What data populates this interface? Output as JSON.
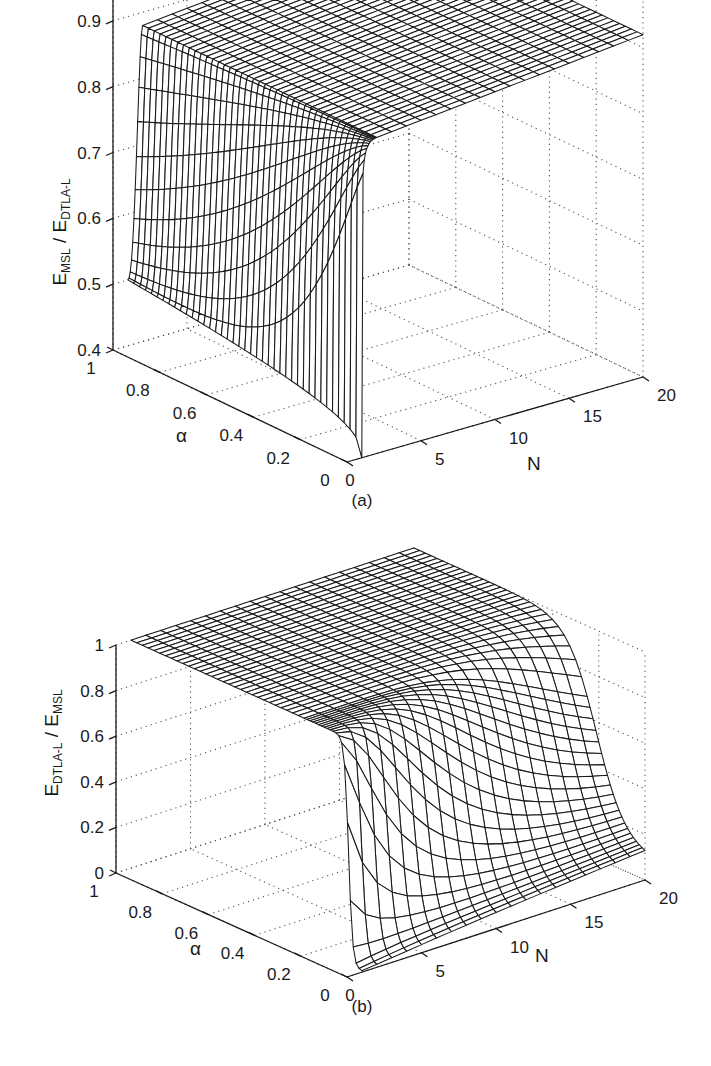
{
  "figures": [
    {
      "id": "a",
      "panel_label": "(a)",
      "z_label_main_1": "E",
      "z_label_sub_1": "MSL",
      "z_label_sep": " / E",
      "z_label_sub_2": "DTLA-L",
      "alpha_label": "α",
      "n_label": "N",
      "z_ticks": [
        "0.4",
        "0.5",
        "0.6",
        "0.7",
        "0.8",
        "0.9",
        "1"
      ],
      "alpha_ticks": [
        "0",
        "0.2",
        "0.4",
        "0.6",
        "0.8",
        "1"
      ],
      "n_ticks": [
        "0",
        "5",
        "10",
        "15",
        "20"
      ]
    },
    {
      "id": "b",
      "panel_label": "(b)",
      "z_label_main_1": "E",
      "z_label_sub_1": "DTLA-L",
      "z_label_sep": " / E",
      "z_label_sub_2": "MSL",
      "alpha_label": "α",
      "n_label": "N",
      "z_ticks": [
        "0",
        "0.2",
        "0.4",
        "0.6",
        "0.8",
        "1"
      ],
      "alpha_ticks": [
        "0",
        "0.2",
        "0.4",
        "0.6",
        "0.8",
        "1"
      ],
      "n_ticks": [
        "0",
        "5",
        "10",
        "15",
        "20"
      ]
    }
  ],
  "chart_data": [
    {
      "type": "surface",
      "title": "(a)",
      "xlabel": "N",
      "ylabel": "α",
      "zlabel": "E_MSL / E_DTLA-L",
      "xlim": [
        0,
        20
      ],
      "ylim": [
        0,
        1
      ],
      "zlim": [
        0.4,
        1
      ],
      "grid": true,
      "description": "Ratio rises from ~0.5 (α=1, N=1) toward 1; at α→0 ratio drops sharply near 0.4 for small N; for N ≥ ~2 the surface is near a flat plateau around 0.88–0.9 that rises slowly to ~0.92 at N=20.",
      "x": [
        1,
        2,
        5,
        10,
        15,
        20
      ],
      "y": [
        0,
        0.2,
        0.4,
        0.6,
        0.8,
        1.0
      ],
      "z_samples": [
        {
          "N": 1,
          "alpha": 1.0,
          "z": 0.5
        },
        {
          "N": 1,
          "alpha": 0.8,
          "z": 0.47
        },
        {
          "N": 1,
          "alpha": 0.6,
          "z": 0.45
        },
        {
          "N": 1,
          "alpha": 0.4,
          "z": 0.43
        },
        {
          "N": 1,
          "alpha": 0.2,
          "z": 0.41
        },
        {
          "N": 1,
          "alpha": 0.0,
          "z": 0.4
        },
        {
          "N": 2,
          "alpha": 1.0,
          "z": 0.83
        },
        {
          "N": 2,
          "alpha": 0.5,
          "z": 0.82
        },
        {
          "N": 2,
          "alpha": 0.0,
          "z": 0.82
        },
        {
          "N": 10,
          "alpha": 0.5,
          "z": 0.89
        },
        {
          "N": 20,
          "alpha": 0.5,
          "z": 0.92
        }
      ]
    },
    {
      "type": "surface",
      "title": "(b)",
      "xlabel": "N",
      "ylabel": "α",
      "zlabel": "E_DTLA-L / E_MSL",
      "xlim": [
        0,
        20
      ],
      "ylim": [
        0,
        1
      ],
      "zlim": [
        0,
        1
      ],
      "grid": true,
      "description": "Ratio equals 1 for α above ~0.3 across all N; for small α the ratio drops with a sigmoid toward ~0 at α=0, with the drop becoming gentler as N grows.",
      "x": [
        1,
        5,
        10,
        15,
        20
      ],
      "y": [
        0,
        0.1,
        0.2,
        0.3,
        0.5,
        1.0
      ],
      "z_samples": [
        {
          "N": 1,
          "alpha": 1.0,
          "z": 1.0
        },
        {
          "N": 20,
          "alpha": 1.0,
          "z": 1.0
        },
        {
          "N": 1,
          "alpha": 0.3,
          "z": 1.0
        },
        {
          "N": 1,
          "alpha": 0.1,
          "z": 0.05
        },
        {
          "N": 1,
          "alpha": 0.0,
          "z": 0.0
        },
        {
          "N": 10,
          "alpha": 0.3,
          "z": 0.97
        },
        {
          "N": 10,
          "alpha": 0.15,
          "z": 0.5
        },
        {
          "N": 10,
          "alpha": 0.0,
          "z": 0.0
        },
        {
          "N": 20,
          "alpha": 0.3,
          "z": 0.98
        },
        {
          "N": 20,
          "alpha": 0.0,
          "z": 0.1
        }
      ]
    }
  ]
}
